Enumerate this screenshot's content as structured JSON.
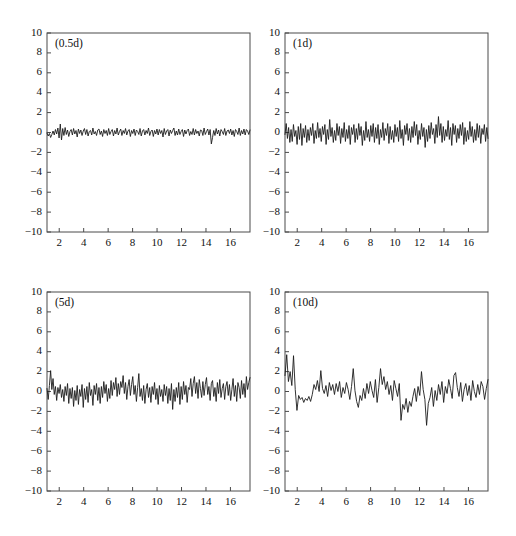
{
  "figure": {
    "background_color": "#ffffff",
    "line_color": "#1c1c1c",
    "axis_color": "#4a4a4a",
    "rows": 2,
    "cols": 2
  },
  "chart_data": [
    {
      "type": "line",
      "title": "(0.5d)",
      "panel_index": 0,
      "xlabel": "",
      "ylabel": "",
      "xlim": [
        1,
        17.6
      ],
      "ylim": [
        -10,
        10
      ],
      "grid": false,
      "legend": "none",
      "xticks": [
        2,
        4,
        6,
        8,
        10,
        12,
        14,
        16
      ],
      "yticks": [
        -10,
        -8,
        -6,
        -4,
        -2,
        0,
        2,
        4,
        6,
        8,
        10
      ],
      "xtick_labels": [
        "2",
        "4",
        "6",
        "8",
        "10",
        "12",
        "14",
        "16"
      ],
      "ytick_labels": [
        "-10",
        "-8",
        "-6",
        "-4",
        "-2",
        "0",
        "2",
        "4",
        "6",
        "8",
        "10"
      ],
      "series": [
        {
          "name": "residual-0.5d",
          "values": [
            -0.05,
            -0.35,
            -0.1,
            -0.5,
            -0.2,
            0.15,
            -0.25,
            0.3,
            -0.15,
            0.45,
            -0.55,
            0.85,
            -0.75,
            0.4,
            -0.3,
            0.5,
            -0.2,
            0.25,
            -0.4,
            0.1,
            0.3,
            -0.25,
            0.4,
            -0.15,
            0.2,
            -0.45,
            0.35,
            -0.1,
            0.25,
            -0.3,
            0.15,
            0.4,
            -0.2,
            0.3,
            -0.35,
            0.1,
            0.2,
            -0.25,
            0.45,
            -0.15,
            0.1,
            -0.3,
            0.25,
            0.35,
            -0.2,
            0.15,
            -0.4,
            0.3,
            -0.1,
            0.2,
            -0.3,
            0.4,
            -0.2,
            0.1,
            0.3,
            -0.35,
            0.2,
            -0.15,
            0.45,
            -0.25,
            0.1,
            0.35,
            -0.3,
            0.2,
            -0.1,
            0.4,
            -0.25,
            0.15,
            0.3,
            -0.4,
            0.2,
            -0.1,
            0.35,
            -0.3,
            0.25,
            0.1,
            -0.2,
            0.4,
            -0.35,
            0.15,
            0.3,
            -0.25,
            0.2,
            -0.1,
            0.45,
            -0.3,
            0.1,
            0.25,
            -0.4,
            0.2,
            -0.15,
            0.35,
            -0.25,
            0.3,
            -0.1,
            0.2,
            -0.45,
            0.4,
            -0.2,
            0.15,
            0.3,
            -0.35,
            0.25,
            -0.1,
            0.2,
            0.45,
            -0.3,
            0.15,
            -0.25,
            0.35,
            -0.2,
            0.1,
            0.3,
            -0.4,
            0.25,
            -0.15,
            0.2,
            0.35,
            -0.3,
            0.1,
            -0.2,
            0.4,
            -0.25,
            0.3,
            -0.1,
            0.15,
            -0.35,
            0.25,
            0.2,
            -0.3,
            0.45,
            -0.2,
            0.1,
            0.35,
            -0.25,
            0.3,
            -1.15,
            -0.5,
            0.2,
            -0.3,
            0.4,
            -0.15,
            0.25,
            -0.35,
            0.3,
            0.1,
            -0.2,
            0.4,
            -0.3,
            0.15,
            0.25,
            -0.1,
            0.35,
            -0.25,
            0.2,
            -0.4,
            0.3,
            0.1,
            -0.2,
            0.45,
            -0.3,
            0.2,
            -0.15,
            0.35,
            -0.25,
            0.3,
            0.15,
            -0.2,
            0.25
          ]
        }
      ],
      "amplitude_range": [
        -1.2,
        0.9
      ],
      "noise_scale": "smallest"
    },
    {
      "type": "line",
      "title": "(1d)",
      "panel_index": 1,
      "xlabel": "",
      "ylabel": "",
      "xlim": [
        1,
        17.6
      ],
      "ylim": [
        -10,
        10
      ],
      "grid": false,
      "legend": "none",
      "xticks": [
        2,
        4,
        6,
        8,
        10,
        12,
        14,
        16
      ],
      "yticks": [
        -10,
        -8,
        -6,
        -4,
        -2,
        0,
        2,
        4,
        6,
        8,
        10
      ],
      "xtick_labels": [
        "2",
        "4",
        "6",
        "8",
        "10",
        "12",
        "14",
        "16"
      ],
      "ytick_labels": [
        "-10",
        "-8",
        "-6",
        "-4",
        "-2",
        "0",
        "2",
        "4",
        "6",
        "8",
        "10"
      ],
      "series": [
        {
          "name": "residual-1d",
          "values": [
            -0.2,
            0.9,
            -0.6,
            0.5,
            -1.0,
            0.3,
            -0.9,
            0.8,
            -0.4,
            0.2,
            -1.2,
            0.6,
            -0.7,
            0.9,
            -1.3,
            0.4,
            -0.5,
            0.7,
            -1.0,
            0.3,
            -0.8,
            0.5,
            -0.3,
            0.9,
            -1.1,
            0.2,
            -0.6,
            1.0,
            -0.5,
            0.4,
            -0.9,
            0.6,
            -0.2,
            0.8,
            -1.2,
            0.3,
            -0.7,
            1.3,
            -0.4,
            0.5,
            -1.0,
            0.2,
            -0.8,
            0.9,
            -0.3,
            0.6,
            -1.1,
            0.4,
            -0.5,
            1.0,
            -0.9,
            0.3,
            -0.6,
            0.7,
            -1.2,
            0.5,
            -0.2,
            0.8,
            -1.0,
            0.4,
            -0.7,
            0.9,
            -0.3,
            0.6,
            -1.3,
            0.2,
            -0.8,
            1.1,
            -0.5,
            0.3,
            -0.9,
            0.7,
            -0.4,
            0.9,
            -1.0,
            0.5,
            -0.6,
            0.8,
            -1.2,
            0.3,
            -0.5,
            1.0,
            -0.8,
            0.4,
            -0.3,
            0.9,
            -1.1,
            0.6,
            -0.7,
            0.2,
            -1.0,
            0.8,
            -0.4,
            0.5,
            -0.9,
            1.2,
            -0.6,
            0.3,
            -1.3,
            0.7,
            -0.2,
            0.9,
            -0.8,
            0.4,
            -1.0,
            0.6,
            -0.5,
            1.1,
            -0.3,
            0.8,
            -1.2,
            0.2,
            -0.7,
            0.9,
            -0.4,
            0.5,
            -1.5,
            0.3,
            -0.9,
            0.7,
            -0.6,
            1.0,
            -0.2,
            0.4,
            -1.1,
            0.8,
            -0.5,
            1.6,
            -0.3,
            0.9,
            -1.0,
            0.6,
            -0.8,
            0.3,
            -0.4,
            1.2,
            -0.7,
            0.5,
            -1.3,
            0.9,
            -0.2,
            0.7,
            -1.0,
            0.4,
            -0.6,
            0.8,
            -0.3,
            1.0,
            -1.2,
            0.5,
            -0.9,
            0.2,
            -0.7,
            1.1,
            -0.4,
            0.6,
            -1.0,
            0.3,
            -0.8,
            0.9,
            -0.5,
            0.7,
            -1.1,
            0.4,
            -0.2,
            0.8,
            -0.9,
            0.5,
            -0.6
          ]
        }
      ],
      "amplitude_range": [
        -1.7,
        1.7
      ],
      "noise_scale": "small"
    },
    {
      "type": "line",
      "title": "(5d)",
      "panel_index": 2,
      "xlabel": "",
      "ylabel": "",
      "xlim": [
        1,
        17.6
      ],
      "ylim": [
        -10,
        10
      ],
      "grid": false,
      "legend": "none",
      "xticks": [
        2,
        4,
        6,
        8,
        10,
        12,
        14,
        16
      ],
      "yticks": [
        -10,
        -8,
        -6,
        -4,
        -2,
        0,
        2,
        4,
        6,
        8,
        10
      ],
      "xtick_labels": [
        "2",
        "4",
        "6",
        "8",
        "10",
        "12",
        "14",
        "16"
      ],
      "ytick_labels": [
        "-10",
        "-8",
        "-6",
        "-4",
        "-2",
        "0",
        "2",
        "4",
        "6",
        "8",
        "10"
      ],
      "series": [
        {
          "name": "residual-5d",
          "values": [
            0.3,
            -0.8,
            0.6,
            2.1,
            0.2,
            1.3,
            -0.3,
            0.5,
            -0.9,
            0.4,
            -0.2,
            0.7,
            -0.6,
            0.2,
            -1.0,
            0.5,
            -0.4,
            0.8,
            -1.2,
            0.3,
            -0.7,
            0.4,
            -1.5,
            0.1,
            -0.9,
            0.6,
            -1.3,
            0.2,
            -0.5,
            0.7,
            -1.6,
            0.3,
            -0.8,
            0.5,
            -1.1,
            0.9,
            -0.4,
            0.2,
            -1.4,
            0.6,
            -0.3,
            0.8,
            -0.9,
            0.4,
            -1.2,
            0.5,
            -0.6,
            1.0,
            -0.2,
            0.7,
            -1.0,
            0.3,
            -0.7,
            1.1,
            -0.4,
            0.9,
            0.2,
            1.4,
            -0.5,
            0.8,
            -0.3,
            1.0,
            0.4,
            1.6,
            -0.2,
            0.9,
            -0.8,
            0.5,
            1.2,
            -0.4,
            0.7,
            1.5,
            -0.3,
            0.6,
            -1.0,
            0.4,
            1.8,
            -0.5,
            0.3,
            -0.9,
            0.6,
            -1.2,
            0.2,
            0.8,
            -0.6,
            0.4,
            -1.1,
            0.5,
            -0.3,
            0.9,
            -0.8,
            0.3,
            -1.3,
            0.6,
            -0.5,
            0.2,
            -1.0,
            0.7,
            -0.4,
            0.5,
            -1.2,
            0.3,
            -0.9,
            0.8,
            -1.8,
            0.2,
            -1.0,
            0.4,
            -0.6,
            0.9,
            -1.3,
            0.5,
            -0.8,
            1.0,
            -0.3,
            0.6,
            -1.1,
            0.4,
            0.2,
            1.3,
            -0.5,
            0.8,
            1.5,
            -0.2,
            0.9,
            -0.7,
            1.2,
            0.3,
            -0.6,
            1.0,
            -0.4,
            0.7,
            1.4,
            -0.3,
            0.5,
            -0.9,
            0.8,
            1.1,
            -0.5,
            0.4,
            -1.0,
            0.9,
            -0.2,
            1.2,
            -0.6,
            0.3,
            0.8,
            -0.8,
            0.5,
            1.0,
            -0.4,
            0.7,
            -0.9,
            0.2,
            1.3,
            -0.5,
            0.6,
            -1.0,
            0.9,
            0.4,
            -0.7,
            1.1,
            -0.3,
            0.8,
            -0.6,
            1.5,
            0.2,
            0.9,
            1.4
          ]
        }
      ],
      "amplitude_range": [
        -2.0,
        2.2
      ],
      "noise_scale": "medium"
    },
    {
      "type": "line",
      "title": "(10d)",
      "panel_index": 3,
      "xlabel": "",
      "ylabel": "",
      "xlim": [
        1,
        17.6
      ],
      "ylim": [
        -10,
        10
      ],
      "grid": false,
      "legend": "none",
      "xticks": [
        2,
        4,
        6,
        8,
        10,
        12,
        14,
        16
      ],
      "yticks": [
        -10,
        -8,
        -6,
        -4,
        -2,
        0,
        2,
        4,
        6,
        8,
        10
      ],
      "xtick_labels": [
        "2",
        "4",
        "6",
        "8",
        "10",
        "12",
        "14",
        "16"
      ],
      "ytick_labels": [
        "-10",
        "-8",
        "-6",
        "-4",
        "-2",
        "0",
        "2",
        "4",
        "6",
        "8",
        "10"
      ],
      "series": [
        {
          "name": "residual-10d",
          "values": [
            1.6,
            3.7,
            1.0,
            2.0,
            0.6,
            3.6,
            0.2,
            -1.9,
            -0.4,
            -0.8,
            -0.6,
            -1.1,
            -0.7,
            -0.9,
            -0.5,
            -1.0,
            -0.3,
            0.7,
            0.2,
            1.1,
            0.0,
            2.1,
            0.3,
            -0.2,
            0.6,
            -0.5,
            0.9,
            0.1,
            0.7,
            -0.3,
            0.8,
            0.0,
            1.0,
            -0.6,
            0.4,
            -0.2,
            0.9,
            0.2,
            -0.8,
            0.5,
            2.3,
            0.1,
            -1.0,
            -1.6,
            -0.4,
            -0.9,
            0.3,
            -0.7,
            0.8,
            -0.2,
            1.0,
            0.1,
            -0.6,
            1.2,
            -1.1,
            0.4,
            2.3,
            0.7,
            1.5,
            0.2,
            1.0,
            -0.3,
            0.6,
            -0.9,
            1.1,
            0.3,
            -0.5,
            0.8,
            -2.9,
            -1.3,
            -1.8,
            -0.7,
            -2.1,
            -1.0,
            -1.5,
            -0.5,
            0.3,
            -1.0,
            0.5,
            -0.4,
            2.0,
            0.2,
            -0.8,
            -3.4,
            -1.2,
            -0.6,
            0.4,
            -1.5,
            0.1,
            -0.9,
            0.7,
            -0.3,
            1.0,
            -1.1,
            0.5,
            -0.2,
            1.2,
            0.3,
            -0.7,
            1.6,
            1.9,
            0.4,
            -0.5,
            0.9,
            -1.0,
            0.2,
            0.8,
            -0.4,
            0.6,
            -0.9,
            1.1,
            0.0,
            -0.6,
            0.7,
            -0.3,
            1.0,
            0.5,
            -0.8,
            0.3,
            1.2
          ]
        }
      ],
      "amplitude_range": [
        -3.4,
        3.7
      ],
      "noise_scale": "largest"
    }
  ]
}
